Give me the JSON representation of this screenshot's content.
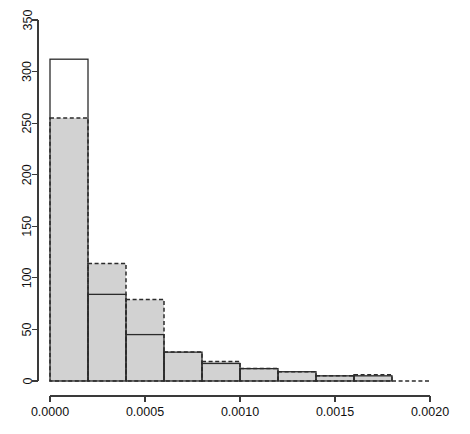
{
  "chart_data": {
    "type": "bar",
    "title": "",
    "subtitle": "",
    "xlabel": "",
    "ylabel": "",
    "xlim": [
      0.0,
      0.002
    ],
    "ylim": [
      0,
      350
    ],
    "grid": false,
    "legend_position": "none",
    "bin_width": 0.0002,
    "bin_edges": [
      0.0,
      0.0002,
      0.0004,
      0.0006,
      0.0008,
      0.001,
      0.0012,
      0.0014,
      0.0016,
      0.0018,
      0.002
    ],
    "categories": [
      "0.0000-0.0002",
      "0.0002-0.0004",
      "0.0004-0.0006",
      "0.0006-0.0008",
      "0.0008-0.0010",
      "0.0010-0.0012",
      "0.0012-0.0014",
      "0.0014-0.0016",
      "0.0016-0.0018",
      "0.0018-0.0020"
    ],
    "series": [
      {
        "name": "solid-outline-histogram",
        "style": "solid outline, unfilled",
        "values": [
          312,
          84,
          45,
          28,
          17,
          12,
          9,
          5,
          5,
          0
        ]
      },
      {
        "name": "dashed-outline-histogram",
        "style": "dashed outline, gray fill",
        "values": [
          255,
          114,
          79,
          28,
          19,
          12,
          9,
          5,
          6,
          0
        ]
      }
    ],
    "xticks": [
      0.0,
      0.0005,
      0.001,
      0.0015,
      0.002
    ],
    "xtick_labels": [
      "0.0000",
      "0.0005",
      "0.0010",
      "0.0015",
      "0.0020"
    ],
    "yticks": [
      0,
      50,
      100,
      150,
      200,
      250,
      300,
      350
    ],
    "ytick_labels": [
      "0",
      "50",
      "100",
      "150",
      "200",
      "250",
      "300",
      "350"
    ]
  },
  "axes": {
    "x_axis_name": "x-axis",
    "y_axis_name": "y-axis"
  }
}
